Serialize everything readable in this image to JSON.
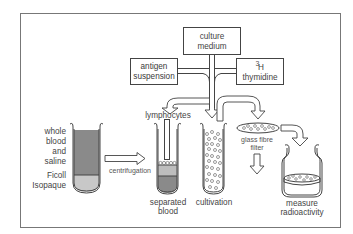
{
  "diagram": {
    "boxes": {
      "culture_medium": {
        "line1": "culture",
        "line2": "medium",
        "fill": "#ffffff"
      },
      "antigen": {
        "line1": "antigen",
        "line2": "suspension",
        "fill": "#8c8c8c"
      },
      "thymidine": {
        "sup": "3",
        "line1": "H",
        "line2": "thymidine",
        "fill": "#efefef"
      }
    },
    "labels": {
      "whole_blood": [
        "whole",
        "blood",
        "and",
        "saline"
      ],
      "ficoll": [
        "Ficoll",
        "Isopaque"
      ],
      "centrifugation": "centrifugation",
      "lymphocytes": "lymphocytes",
      "separated_blood": [
        "separated",
        "blood"
      ],
      "cultivation": "cultivation",
      "glass_fibre_filter": [
        "glass fibre",
        "filter"
      ],
      "measure_radioactivity": [
        "measure",
        "radioactivity"
      ]
    },
    "colors": {
      "dark_blood": "#8a8a8a",
      "ficoll_layer": "#c8c8c8",
      "mid_layer": "#bdbdbd",
      "frame": "#666666"
    }
  }
}
